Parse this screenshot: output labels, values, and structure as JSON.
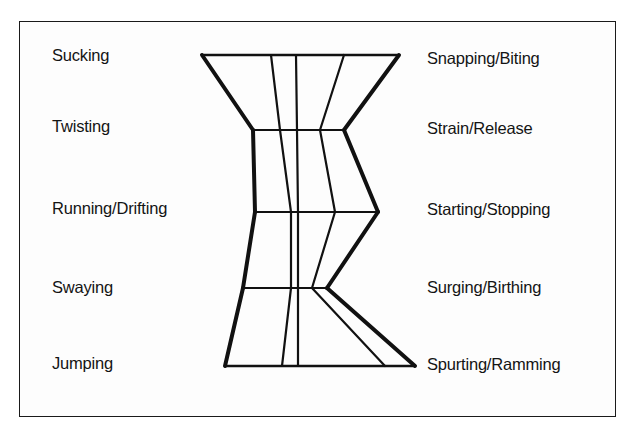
{
  "diagram": {
    "left_labels": [
      {
        "text": "Sucking",
        "x": 52,
        "y": 47
      },
      {
        "text": "Twisting",
        "x": 52,
        "y": 118
      },
      {
        "text": "Running/Drifting",
        "x": 52,
        "y": 200
      },
      {
        "text": "Swaying",
        "x": 52,
        "y": 279
      },
      {
        "text": "Jumping",
        "x": 52,
        "y": 355
      }
    ],
    "right_labels": [
      {
        "text": "Snapping/Biting",
        "x": 427,
        "y": 50
      },
      {
        "text": "Strain/Release",
        "x": 427,
        "y": 120
      },
      {
        "text": "Starting/Stopping",
        "x": 427,
        "y": 201
      },
      {
        "text": "Surging/Birthing",
        "x": 427,
        "y": 279
      },
      {
        "text": "Spurting/Ramming",
        "x": 427,
        "y": 356
      }
    ],
    "rows": [
      {
        "y": 55,
        "left": 202,
        "lines": [
          271,
          296,
          344
        ],
        "right": 399
      },
      {
        "y": 130,
        "left": 253,
        "lines": [
          280,
          297,
          320
        ],
        "right": 344
      },
      {
        "y": 212,
        "left": 255,
        "lines": [
          291,
          298,
          335
        ],
        "right": 378
      },
      {
        "y": 288,
        "left": 243,
        "lines": [
          291,
          298,
          312
        ],
        "right": 327
      },
      {
        "y": 366,
        "left": 225,
        "lines": [
          282,
          298,
          385
        ],
        "right": 415
      }
    ],
    "stroke_color": "#111111"
  }
}
